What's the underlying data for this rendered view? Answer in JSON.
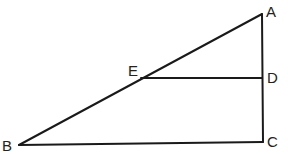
{
  "diagram": {
    "type": "geometry-figure",
    "points": {
      "A": {
        "label": "A",
        "x": 262,
        "y": 14,
        "label_x": 266,
        "label_y": 17
      },
      "B": {
        "label": "B",
        "x": 19,
        "y": 145,
        "label_x": 2,
        "label_y": 151
      },
      "C": {
        "label": "C",
        "x": 263,
        "y": 142,
        "label_x": 267,
        "label_y": 147
      },
      "D": {
        "label": "D",
        "x": 262,
        "y": 78,
        "label_x": 267,
        "label_y": 83
      },
      "E": {
        "label": "E",
        "x": 141,
        "y": 78,
        "label_x": 128,
        "label_y": 76
      }
    },
    "segments": [
      {
        "name": "AB",
        "from": "A",
        "to": "B"
      },
      {
        "name": "AC",
        "from": "A",
        "to": "C"
      },
      {
        "name": "BC",
        "from": "B",
        "to": "C"
      },
      {
        "name": "ED",
        "from": "E",
        "to": "D"
      }
    ],
    "stroke_color": "#1a1a1a",
    "label_color": "#222222"
  }
}
